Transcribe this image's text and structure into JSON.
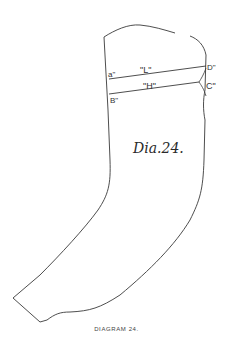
{
  "figure": {
    "title_handwritten": "Dia.24.",
    "caption": "DIAGRAM 24.",
    "points": {
      "a": "a\"",
      "b": "B\"",
      "c": "C\"",
      "d": "D\""
    },
    "line_labels": {
      "upper": "\"L\"",
      "lower": "\"H\""
    },
    "colors": {
      "line": "#3a3a3a",
      "background": "#ffffff"
    }
  }
}
